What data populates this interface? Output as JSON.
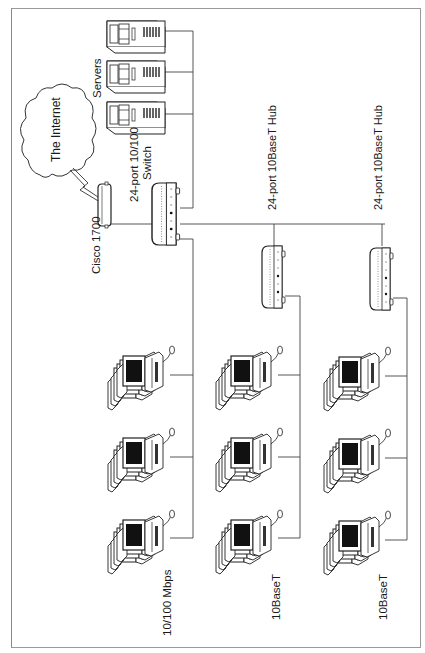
{
  "diagram": {
    "title": "",
    "orientation": "rotated-90-ccw",
    "labels": {
      "internet": "The Internet",
      "router": "Cisco 1700",
      "switch_line1": "24-port 10/100",
      "switch_line2": "Switch",
      "servers": "Servers",
      "hub1": "24-port 10BaseT Hub",
      "hub2": "24-port 10BaseT Hub",
      "group1": "10/100 Mbps",
      "group2": "10BaseT",
      "group3": "10BaseT"
    },
    "nodes": [
      {
        "id": "internet",
        "type": "cloud",
        "label": "The Internet"
      },
      {
        "id": "router",
        "type": "router",
        "label": "Cisco 1700"
      },
      {
        "id": "switch",
        "type": "switch",
        "label": "24-port 10/100 Switch"
      },
      {
        "id": "server1",
        "type": "server"
      },
      {
        "id": "server2",
        "type": "server"
      },
      {
        "id": "server3",
        "type": "server"
      },
      {
        "id": "hub1",
        "type": "hub",
        "label": "24-port 10BaseT Hub"
      },
      {
        "id": "hub2",
        "type": "hub",
        "label": "24-port 10BaseT Hub"
      },
      {
        "id": "pcgroup1",
        "type": "workstation-stack-x3",
        "label": "10/100 Mbps"
      },
      {
        "id": "pcgroup2",
        "type": "workstation-stack-x3",
        "label": "10BaseT"
      },
      {
        "id": "pcgroup3",
        "type": "workstation-stack-x3",
        "label": "10BaseT"
      }
    ],
    "edges": [
      {
        "from": "internet",
        "to": "router",
        "style": "lightning"
      },
      {
        "from": "router",
        "to": "switch"
      },
      {
        "from": "switch",
        "to": "server1"
      },
      {
        "from": "switch",
        "to": "server2"
      },
      {
        "from": "switch",
        "to": "server3"
      },
      {
        "from": "switch",
        "to": "hub1"
      },
      {
        "from": "switch",
        "to": "hub2"
      },
      {
        "from": "switch",
        "to": "pcgroup1"
      },
      {
        "from": "hub1",
        "to": "pcgroup2"
      },
      {
        "from": "hub2",
        "to": "pcgroup3"
      }
    ]
  }
}
